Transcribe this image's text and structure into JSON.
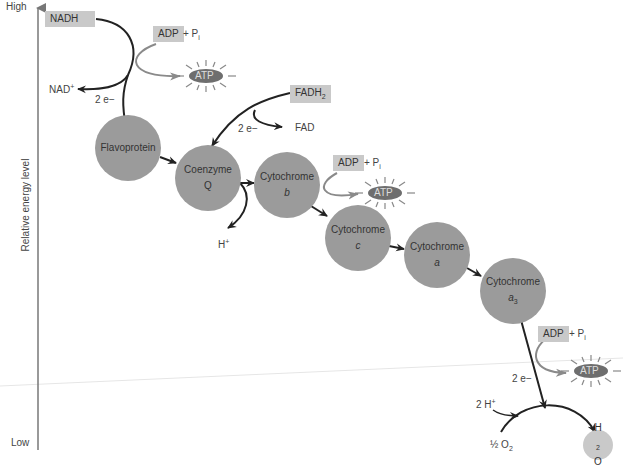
{
  "axis": {
    "high": "High",
    "low": "Low",
    "label": "Relative energy level"
  },
  "donors": {
    "nadh": "NADH",
    "nad_plus": "NAD",
    "nad_sup": "+",
    "fadh2": "FADH",
    "fadh2_sub": "2",
    "fad": "FAD"
  },
  "electrons": {
    "label": "2 e−"
  },
  "nodes": [
    {
      "line1": "Flavoprotein",
      "line2": ""
    },
    {
      "line1": "Coenzyme",
      "line2": "Q"
    },
    {
      "line1": "Cytochrome",
      "line2": "b"
    },
    {
      "line1": "Cytochrome",
      "line2": "c"
    },
    {
      "line1": "Cytochrome",
      "line2": "a"
    },
    {
      "line1": "Cytochrome",
      "line2": "a",
      "sub": "3"
    }
  ],
  "atp_sites": [
    {
      "adp": "ADP",
      "plus": "+ P",
      "sub": "i",
      "atp": "ATP"
    },
    {
      "adp": "ADP",
      "plus": "+ P",
      "sub": "i",
      "atp": "ATP"
    },
    {
      "adp": "ADP",
      "plus": "+ P",
      "sub": "i",
      "atp": "ATP"
    }
  ],
  "proton": {
    "h_plus": "H",
    "sup": "+"
  },
  "final": {
    "two_h": "2 H",
    "two_h_sup": "+",
    "half_o2": "½ O",
    "o2_sub": "2",
    "water": "H",
    "water_sub": "2",
    "water_o": "O"
  },
  "colors": {
    "node": "#9b9b9b",
    "box": "#c9c9c9",
    "atp": "#6e6e6e",
    "arrow": "#222222",
    "grey_arrow": "#8a8a8a"
  }
}
